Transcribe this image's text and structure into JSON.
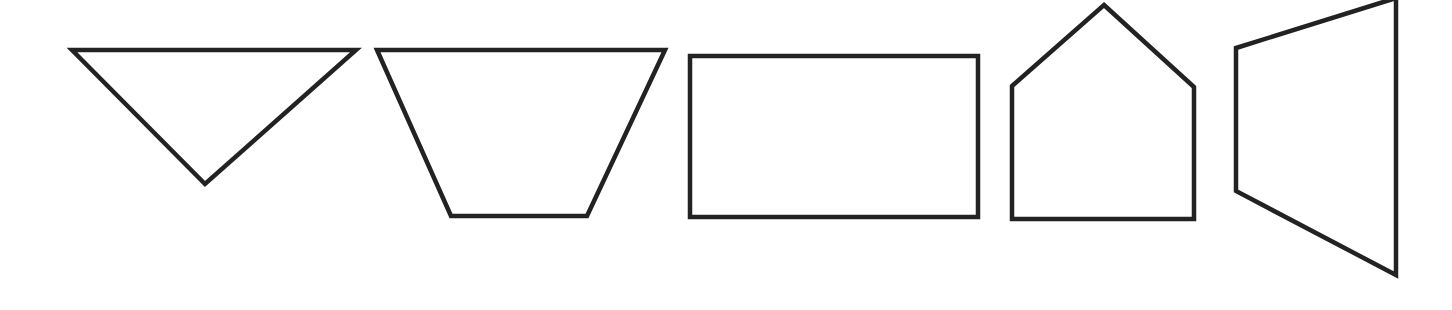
{
  "canvas": {
    "width": 1452,
    "height": 310,
    "background": "#ffffff",
    "stroke_color": "#222222",
    "stroke_width": 4.5
  },
  "shapes": [
    {
      "name": "inverted-triangle",
      "type": "triangle",
      "points": [
        [
          72,
          50
        ],
        [
          356,
          50
        ],
        [
          205,
          184
        ]
      ]
    },
    {
      "name": "inverted-trapezoid",
      "type": "trapezoid",
      "points": [
        [
          377,
          50
        ],
        [
          665,
          50
        ],
        [
          587,
          216
        ],
        [
          451,
          216
        ]
      ]
    },
    {
      "name": "rectangle",
      "type": "rectangle",
      "points": [
        [
          690,
          56
        ],
        [
          978,
          56
        ],
        [
          978,
          217
        ],
        [
          690,
          217
        ]
      ]
    },
    {
      "name": "house-pentagon",
      "type": "pentagon",
      "points": [
        [
          1104,
          5
        ],
        [
          1194,
          87
        ],
        [
          1194,
          219
        ],
        [
          1012,
          219
        ],
        [
          1012,
          86
        ]
      ]
    },
    {
      "name": "side-trapezoid",
      "type": "trapezoid",
      "points": [
        [
          1236,
          48
        ],
        [
          1396,
          -2
        ],
        [
          1396,
          275
        ],
        [
          1236,
          191
        ]
      ]
    }
  ]
}
